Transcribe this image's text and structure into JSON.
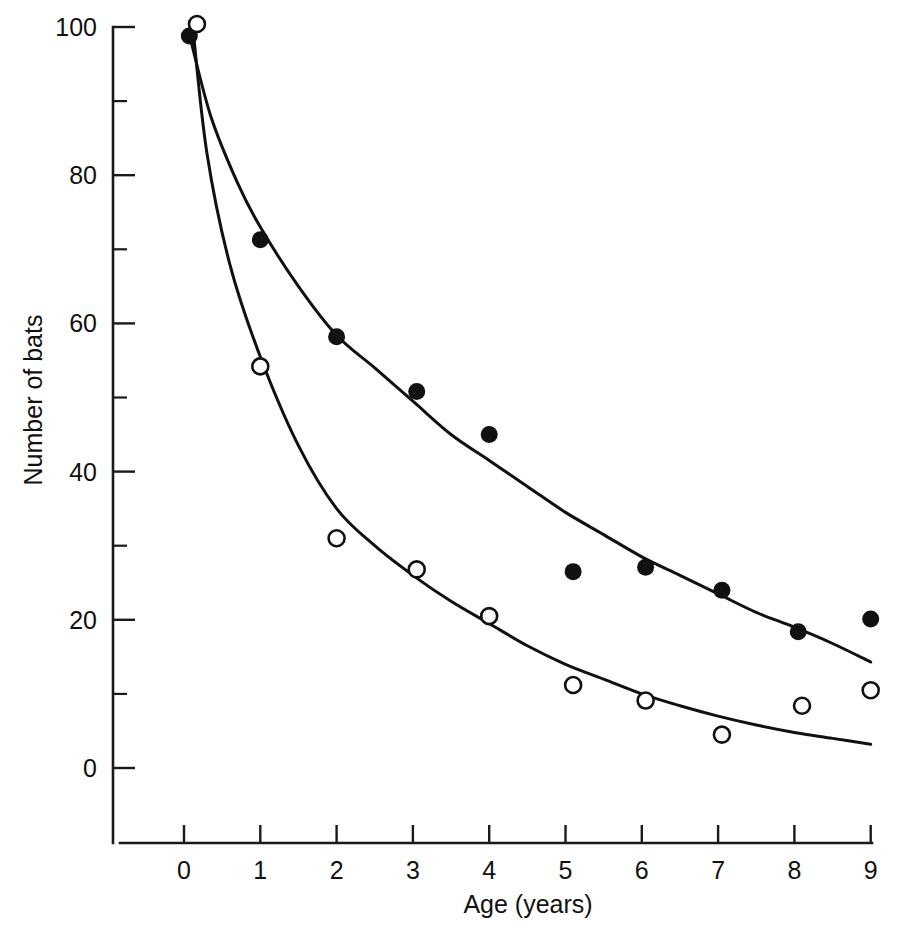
{
  "figure": {
    "background_color": "#ffffff",
    "ink_color": "#111111"
  },
  "chart_data": {
    "type": "scatter",
    "title": "",
    "subtitle": "",
    "xlabel": "Age (years)",
    "ylabel": "Number of bats",
    "xlim": [
      0,
      9
    ],
    "ylim": [
      0,
      100
    ],
    "grid": false,
    "legend": "none",
    "x_ticks": [
      0,
      1,
      2,
      3,
      4,
      5,
      6,
      7,
      8,
      9
    ],
    "x_tick_labels": [
      "0",
      "1",
      "2",
      "3",
      "4",
      "5",
      "6",
      "7",
      "8",
      "9"
    ],
    "y_ticks_major": [
      0,
      20,
      40,
      60,
      80,
      100
    ],
    "y_tick_labels": [
      "0",
      "20",
      "40",
      "60",
      "80",
      "100"
    ],
    "y_ticks_minor": [
      10,
      30,
      50,
      70,
      90
    ],
    "series": [
      {
        "name": "filled-circles",
        "marker": "filled-circle",
        "points": [
          {
            "x": 0.07,
            "y": 98.8
          },
          {
            "x": 1.0,
            "y": 71.3
          },
          {
            "x": 2.0,
            "y": 58.2
          },
          {
            "x": 3.05,
            "y": 50.8
          },
          {
            "x": 4.0,
            "y": 45.0
          },
          {
            "x": 5.1,
            "y": 26.5
          },
          {
            "x": 6.05,
            "y": 27.1
          },
          {
            "x": 7.05,
            "y": 24.0
          },
          {
            "x": 8.05,
            "y": 18.4
          },
          {
            "x": 9.0,
            "y": 20.1
          }
        ]
      },
      {
        "name": "open-circles",
        "marker": "open-circle",
        "points": [
          {
            "x": 0.17,
            "y": 100.4
          },
          {
            "x": 1.0,
            "y": 54.2
          },
          {
            "x": 2.0,
            "y": 31.0
          },
          {
            "x": 3.05,
            "y": 26.8
          },
          {
            "x": 4.0,
            "y": 20.5
          },
          {
            "x": 5.1,
            "y": 11.2
          },
          {
            "x": 6.05,
            "y": 9.1
          },
          {
            "x": 7.05,
            "y": 4.5
          },
          {
            "x": 8.1,
            "y": 8.4
          },
          {
            "x": 9.0,
            "y": 10.5
          }
        ]
      }
    ],
    "fit_curves": [
      {
        "name": "upper-fit-curve",
        "for_series": "filled-circles",
        "points": [
          {
            "x": 0.07,
            "y": 99.0
          },
          {
            "x": 0.35,
            "y": 88.0
          },
          {
            "x": 0.7,
            "y": 79.0
          },
          {
            "x": 1.0,
            "y": 73.0
          },
          {
            "x": 1.5,
            "y": 65.0
          },
          {
            "x": 2.0,
            "y": 58.4
          },
          {
            "x": 2.5,
            "y": 54.0
          },
          {
            "x": 3.0,
            "y": 49.5
          },
          {
            "x": 3.5,
            "y": 45.0
          },
          {
            "x": 4.0,
            "y": 41.5
          },
          {
            "x": 4.5,
            "y": 38.0
          },
          {
            "x": 5.0,
            "y": 34.5
          },
          {
            "x": 5.5,
            "y": 31.5
          },
          {
            "x": 6.0,
            "y": 28.5
          },
          {
            "x": 6.5,
            "y": 26.0
          },
          {
            "x": 7.0,
            "y": 23.5
          },
          {
            "x": 7.5,
            "y": 21.0
          },
          {
            "x": 8.0,
            "y": 19.0
          },
          {
            "x": 8.5,
            "y": 16.8
          },
          {
            "x": 9.0,
            "y": 14.3
          }
        ]
      },
      {
        "name": "lower-fit-curve",
        "for_series": "open-circles",
        "points": [
          {
            "x": 0.12,
            "y": 99.5
          },
          {
            "x": 0.3,
            "y": 83.0
          },
          {
            "x": 0.6,
            "y": 68.0
          },
          {
            "x": 1.0,
            "y": 55.5
          },
          {
            "x": 1.5,
            "y": 43.5
          },
          {
            "x": 2.0,
            "y": 35.0
          },
          {
            "x": 2.5,
            "y": 30.0
          },
          {
            "x": 3.0,
            "y": 26.0
          },
          {
            "x": 3.5,
            "y": 22.5
          },
          {
            "x": 4.0,
            "y": 19.5
          },
          {
            "x": 4.5,
            "y": 16.5
          },
          {
            "x": 5.0,
            "y": 14.0
          },
          {
            "x": 5.5,
            "y": 12.0
          },
          {
            "x": 6.0,
            "y": 10.0
          },
          {
            "x": 6.5,
            "y": 8.4
          },
          {
            "x": 7.0,
            "y": 7.0
          },
          {
            "x": 7.5,
            "y": 5.8
          },
          {
            "x": 8.0,
            "y": 4.8
          },
          {
            "x": 8.5,
            "y": 4.0
          },
          {
            "x": 9.0,
            "y": 3.2
          }
        ]
      }
    ]
  }
}
